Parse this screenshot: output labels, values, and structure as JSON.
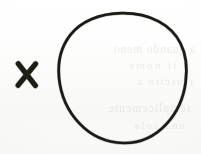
{
  "document": {
    "kind": "scanned-paper-fragment",
    "background_color": "#fdfdfc",
    "ink_color": "#14130f",
    "width_px": 201,
    "height_px": 154
  },
  "marks": {
    "circle": {
      "icon": "hand-drawn-circle-icon",
      "label": "O",
      "stroke_color": "#16150f",
      "stroke_width_px": 2.6,
      "center_x": 122,
      "center_y": 78,
      "radius_x": 63,
      "radius_y": 65
    },
    "cross": {
      "icon": "x-mark-icon",
      "label": "X",
      "stroke_color": "#17160f",
      "stroke_width_px": 5,
      "left": 17,
      "top": 64,
      "width": 20,
      "height": 22
    }
  },
  "showthrough": {
    "note": "faint mirrored bleed-through text from reverse side of sheet",
    "opacity": 0.085,
    "color": "#3a3a38",
    "lines": [
      "a quando meno",
      "e il nome",
      "riuscito a",
      "semplicemente",
      "una sola"
    ]
  }
}
